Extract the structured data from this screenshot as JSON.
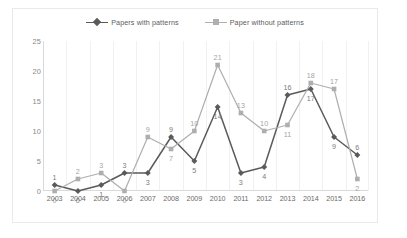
{
  "chart_data": {
    "type": "line",
    "title": "",
    "xlabel": "",
    "ylabel": "",
    "categories": [
      "2003",
      "2004",
      "2005",
      "2006",
      "2007",
      "2008",
      "2009",
      "2010",
      "2011",
      "2012",
      "2013",
      "2014",
      "2015",
      "2016"
    ],
    "series": [
      {
        "name": "Papers with patterns",
        "marker": "diamond",
        "color": "#5a5a5a",
        "values": [
          1,
          0,
          1,
          3,
          3,
          9,
          5,
          14,
          3,
          4,
          16,
          17,
          9,
          6
        ]
      },
      {
        "name": "Paper without patterns",
        "marker": "square",
        "color": "#aeaeae",
        "values": [
          0,
          2,
          3,
          0,
          9,
          7,
          10,
          21,
          13,
          10,
          11,
          18,
          17,
          2
        ]
      }
    ],
    "ylim": [
      0,
      25
    ],
    "yticks": [
      0,
      5,
      10,
      15,
      20,
      25
    ],
    "grid": "vertical-only",
    "legend_position": "top-center",
    "data_labels": true
  },
  "legend": {
    "items": [
      {
        "label": "Papers with patterns"
      },
      {
        "label": "Paper without patterns"
      }
    ]
  }
}
